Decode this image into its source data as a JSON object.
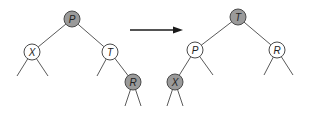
{
  "diagram": {
    "colors": {
      "shaded": "#9a9a9a",
      "unshaded": "#ffffff",
      "edge": "#5a5a5a",
      "arrow": "#1a1a1a"
    },
    "node_radius": 8,
    "before": {
      "nodes": [
        {
          "id": "P",
          "label": "P",
          "x": 72,
          "y": 19,
          "shaded": true
        },
        {
          "id": "X",
          "label": "X",
          "x": 32,
          "y": 52,
          "shaded": false
        },
        {
          "id": "T",
          "label": "T",
          "x": 110,
          "y": 52,
          "shaded": false
        },
        {
          "id": "R",
          "label": "R",
          "x": 133,
          "y": 82,
          "shaded": true
        }
      ],
      "edges": [
        {
          "from": [
            72,
            19
          ],
          "to": [
            32,
            52
          ]
        },
        {
          "from": [
            72,
            19
          ],
          "to": [
            110,
            52
          ]
        },
        {
          "from": [
            110,
            52
          ],
          "to": [
            133,
            82
          ]
        },
        {
          "from": [
            32,
            52
          ],
          "to": [
            17,
            76
          ]
        },
        {
          "from": [
            32,
            52
          ],
          "to": [
            48,
            76
          ]
        },
        {
          "from": [
            110,
            52
          ],
          "to": [
            97,
            76
          ]
        },
        {
          "from": [
            133,
            82
          ],
          "to": [
            125,
            106
          ]
        },
        {
          "from": [
            133,
            82
          ],
          "to": [
            141,
            106
          ]
        }
      ]
    },
    "arrow": {
      "x1": 130,
      "y1": 30,
      "x2": 183,
      "y2": 30
    },
    "after": {
      "nodes": [
        {
          "id": "T",
          "label": "T",
          "x": 238,
          "y": 17,
          "shaded": true
        },
        {
          "id": "P",
          "label": "P",
          "x": 195,
          "y": 50,
          "shaded": false
        },
        {
          "id": "R",
          "label": "R",
          "x": 277,
          "y": 50,
          "shaded": false
        },
        {
          "id": "X",
          "label": "X",
          "x": 175,
          "y": 82,
          "shaded": true
        }
      ],
      "edges": [
        {
          "from": [
            238,
            17
          ],
          "to": [
            195,
            50
          ]
        },
        {
          "from": [
            238,
            17
          ],
          "to": [
            277,
            50
          ]
        },
        {
          "from": [
            195,
            50
          ],
          "to": [
            175,
            82
          ]
        },
        {
          "from": [
            195,
            50
          ],
          "to": [
            213,
            75
          ]
        },
        {
          "from": [
            277,
            50
          ],
          "to": [
            264,
            75
          ]
        },
        {
          "from": [
            277,
            50
          ],
          "to": [
            293,
            75
          ]
        },
        {
          "from": [
            175,
            82
          ],
          "to": [
            167,
            106
          ]
        },
        {
          "from": [
            175,
            82
          ],
          "to": [
            183,
            106
          ]
        }
      ]
    }
  }
}
